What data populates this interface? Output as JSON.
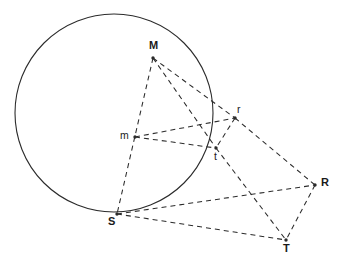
{
  "figure": {
    "type": "geometry-diagram",
    "background_color": "#ffffff",
    "stroke_color": "#2b2b2b",
    "label_color": "#1a1a1a",
    "width": 341,
    "height": 274
  },
  "circle": {
    "name": "main-circle",
    "center_label": "m",
    "center": {
      "x": 114,
      "y": 113
    },
    "radius": 99,
    "style": "solid"
  },
  "points": [
    {
      "id": "M",
      "label": "M",
      "x": 153,
      "y": 58,
      "label_x": 149,
      "label_y": 40,
      "label_weight": "bold"
    },
    {
      "id": "m",
      "label": "m",
      "x": 135,
      "y": 137,
      "label_x": 120,
      "label_y": 130,
      "label_weight": "normal"
    },
    {
      "id": "r",
      "label": "r",
      "x": 235,
      "y": 118,
      "label_x": 237,
      "label_y": 104,
      "label_weight": "normal"
    },
    {
      "id": "t",
      "label": "t",
      "x": 216,
      "y": 148,
      "label_x": 214,
      "label_y": 151,
      "label_weight": "normal"
    },
    {
      "id": "S",
      "label": "S",
      "x": 117,
      "y": 214,
      "label_x": 108,
      "label_y": 216,
      "label_weight": "bold"
    },
    {
      "id": "R",
      "label": "R",
      "x": 315,
      "y": 185,
      "label_x": 321,
      "label_y": 177,
      "label_weight": "bold"
    },
    {
      "id": "T",
      "label": "T",
      "x": 286,
      "y": 240,
      "label_x": 283,
      "label_y": 243,
      "label_weight": "bold"
    }
  ],
  "segments": [
    {
      "name": "segment-M-S",
      "from": "M",
      "to": "S",
      "style": "dashed"
    },
    {
      "name": "segment-M-r",
      "from": "M",
      "to": "r",
      "style": "dashed"
    },
    {
      "name": "segment-M-t",
      "from": "M",
      "to": "t",
      "style": "dashed"
    },
    {
      "name": "segment-m-r",
      "from": "m",
      "to": "r",
      "style": "dashed"
    },
    {
      "name": "segment-m-t",
      "from": "m",
      "to": "t",
      "style": "dashed"
    },
    {
      "name": "segment-r-t",
      "from": "r",
      "to": "t",
      "style": "dashed"
    },
    {
      "name": "segment-r-R",
      "from": "r",
      "to": "R",
      "style": "dashed"
    },
    {
      "name": "segment-t-T",
      "from": "t",
      "to": "T",
      "style": "dashed"
    },
    {
      "name": "segment-S-R",
      "from": "S",
      "to": "R",
      "style": "dashed"
    },
    {
      "name": "segment-S-T",
      "from": "S",
      "to": "T",
      "style": "dashed"
    },
    {
      "name": "segment-R-T",
      "from": "R",
      "to": "T",
      "style": "dashed"
    }
  ],
  "caption": {
    "text": ""
  }
}
